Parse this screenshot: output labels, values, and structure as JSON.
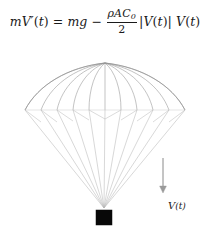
{
  "equation": {
    "full_text": "mV'(t) = mg - (rho A C0 / 2) |V(t)| V(t)",
    "lhs": {
      "mass": "m",
      "velocity_symbol": "V",
      "prime": "′",
      "arg_open": "(",
      "arg_var": "t",
      "arg_close": ")"
    },
    "equals": "=",
    "gravity_term": {
      "mass": "m",
      "g": "g"
    },
    "minus": "−",
    "drag_fraction": {
      "numerator_rho": "ρ",
      "numerator_area": "A",
      "numerator_coeff": "C",
      "numerator_coeff_sub": "0",
      "denominator": "2"
    },
    "speed_factor": {
      "bar_open": "|",
      "symbol": "V",
      "arg_open": "(",
      "arg_var": "t",
      "arg_close": ")",
      "bar_close": "|"
    },
    "velocity_factor": {
      "symbol": "V",
      "arg_open": "(",
      "arg_var": "t",
      "arg_close": ")"
    }
  },
  "figure": {
    "canopy": {
      "apex_x": 105,
      "apex_y": 23,
      "rim_y": 70,
      "rim_left_x": 25,
      "rim_right_x": 185,
      "gore_count": 11
    },
    "payload": {
      "x": 96,
      "y": 170,
      "width": 16,
      "height": 15,
      "color": "#080808"
    },
    "shroud_lines": {
      "converge_x": 104,
      "converge_y": 168,
      "count": 11
    },
    "velocity_arrow": {
      "label": "V(t)",
      "label_symbol": "V",
      "label_arg": "(t)",
      "x": 163,
      "top_y": 118,
      "bottom_y": 152,
      "direction": "down"
    },
    "colors": {
      "canopy_line": "#9a9a9a",
      "shroud_line": "#b8b8b8",
      "rim_line": "#c2c2c2",
      "payload": "#080808",
      "arrow": "#8a8a8a",
      "text": "#1a1a1a",
      "background": "#ffffff"
    }
  }
}
